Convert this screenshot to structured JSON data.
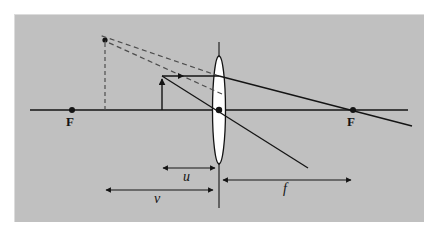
{
  "figure": {
    "type": "optics-ray-diagram",
    "background_color": "#ffffff",
    "panel_color": "#c0c0c0",
    "ink_color": "#141414",
    "lens_fill_color": "#ffffff",
    "panel": {
      "x": 14,
      "y": 14,
      "width": 410,
      "height": 208
    }
  },
  "labels": {
    "focal_point_left": "F",
    "focal_point_right": "F",
    "object_distance": "u",
    "image_distance": "v",
    "focal_length": "f"
  },
  "geometry": {
    "principal_axis": {
      "y": 110,
      "x_start": 30,
      "x_end": 408
    },
    "lens": {
      "center_x": 219,
      "center_y": 110,
      "rx": 6.5,
      "ry": 54
    },
    "optical_center_dot": {
      "x": 219,
      "y": 110,
      "r": 3
    },
    "focal_point_left_dot": {
      "x": 72,
      "y": 110,
      "r": 3
    },
    "focal_point_right_dot": {
      "x": 353,
      "y": 110,
      "r": 3
    },
    "object_arrow": {
      "x": 162,
      "y_base": 110,
      "y_tip": 76
    },
    "image_arrow_dashed": {
      "x": 105,
      "y_base": 110,
      "y_tip": 40
    },
    "ray_parallel_incident": {
      "x1": 162,
      "y1": 76,
      "x2": 219,
      "y2": 76
    },
    "ray_through_focus_refracted": {
      "x1": 219,
      "y1": 76,
      "x2": 412,
      "y2": 126
    },
    "ray_through_center": {
      "x1": 162,
      "y1": 76,
      "x2": 308,
      "y2": 168
    },
    "virtual_ray_upper_dashed": {
      "x1": 219,
      "y1": 76,
      "x2": 100,
      "y2": 36
    },
    "virtual_ray_lower_dashed": {
      "x1": 219,
      "y1": 93,
      "x2": 105,
      "y2": 40
    },
    "measure_u": {
      "y": 168,
      "x1": 162,
      "x2": 216
    },
    "measure_v": {
      "y": 190,
      "x1": 105,
      "x2": 214
    },
    "measure_f": {
      "y": 180,
      "x1": 222,
      "x2": 352
    }
  },
  "label_positions": {
    "F_left": {
      "x": 66,
      "y": 115
    },
    "F_right": {
      "x": 347,
      "y": 115
    },
    "u": {
      "x": 183,
      "y": 171
    },
    "v": {
      "x": 153,
      "y": 192
    },
    "f": {
      "x": 282,
      "y": 182
    }
  }
}
